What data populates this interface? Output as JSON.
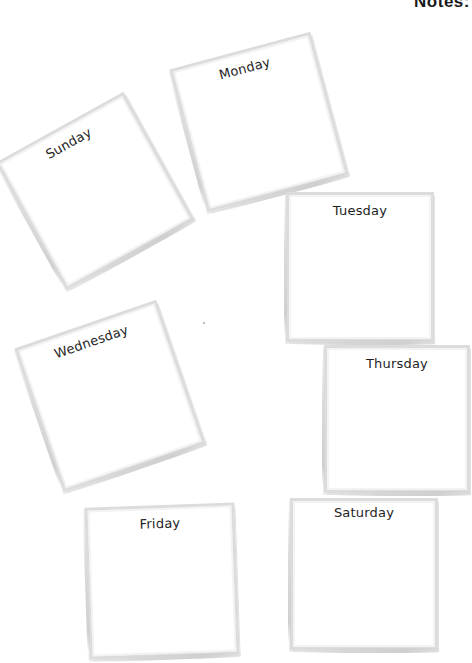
{
  "page": {
    "notes_heading": "Notes:"
  },
  "frames": [
    {
      "day": "Sunday",
      "left": 22,
      "top": 110,
      "width": 146,
      "height": 146,
      "rotate": -29
    },
    {
      "day": "Monday",
      "left": 186,
      "top": 45,
      "width": 146,
      "height": 148,
      "rotate": -15
    },
    {
      "day": "Tuesday",
      "left": 286,
      "top": 192,
      "width": 148,
      "height": 150,
      "rotate": 0
    },
    {
      "day": "Wednesday",
      "left": 35,
      "top": 317,
      "width": 150,
      "height": 152,
      "rotate": -19
    },
    {
      "day": "Thursday",
      "left": 324,
      "top": 345,
      "width": 146,
      "height": 148,
      "rotate": 0
    },
    {
      "day": "Friday",
      "left": 87,
      "top": 505,
      "width": 150,
      "height": 152,
      "rotate": -2
    },
    {
      "day": "Saturday",
      "left": 290,
      "top": 498,
      "width": 148,
      "height": 152,
      "rotate": 0
    }
  ]
}
